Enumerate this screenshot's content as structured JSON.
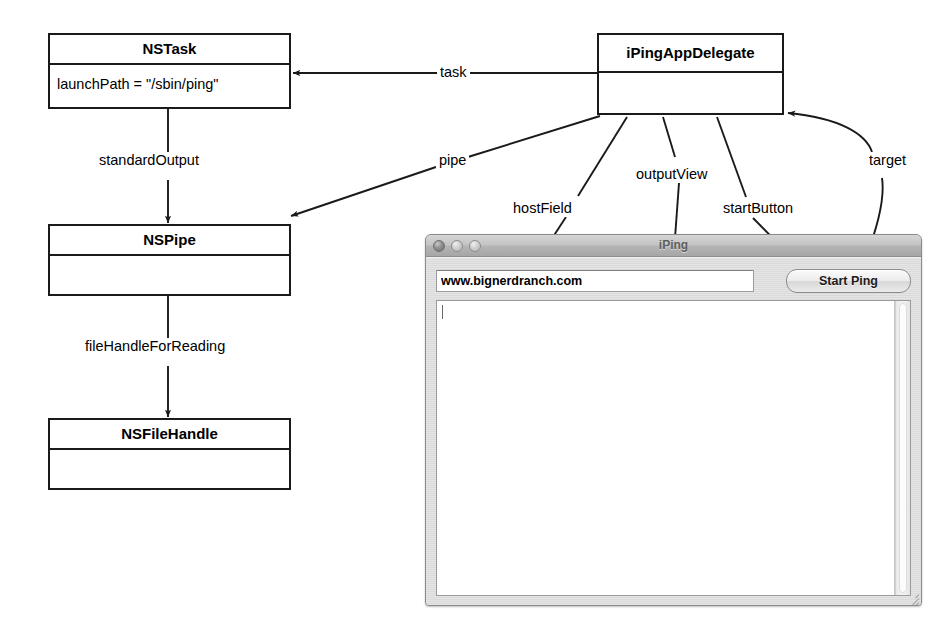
{
  "diagram": {
    "boxes": [
      {
        "name": "nstask",
        "title": "NSTask",
        "body": "launchPath = \"/sbin/ping\""
      },
      {
        "name": "nspipe",
        "title": "NSPipe",
        "body": ""
      },
      {
        "name": "nsfilehandle",
        "title": "NSFileHandle",
        "body": ""
      },
      {
        "name": "ipingdelegate",
        "title": "iPingAppDelegate",
        "body": ""
      }
    ],
    "edge_labels": [
      {
        "name": "task",
        "text": "task"
      },
      {
        "name": "standard-output",
        "text": "standardOutput"
      },
      {
        "name": "pipe",
        "text": "pipe"
      },
      {
        "name": "file-handle-for-reading",
        "text": "fileHandleForReading"
      },
      {
        "name": "host-field",
        "text": "hostField"
      },
      {
        "name": "output-view",
        "text": "outputView"
      },
      {
        "name": "start-button",
        "text": "startButton"
      },
      {
        "name": "target",
        "text": "target"
      }
    ],
    "stroke_color": "#1a1a1a"
  },
  "app_window": {
    "title": "iPing",
    "traffic_lights": [
      "close-button",
      "minimize-button",
      "zoom-button"
    ],
    "host_field": {
      "value": "www.bignerdranch.com",
      "placeholder": ""
    },
    "start_button_label": "Start Ping",
    "output_view": {
      "value": ""
    }
  }
}
